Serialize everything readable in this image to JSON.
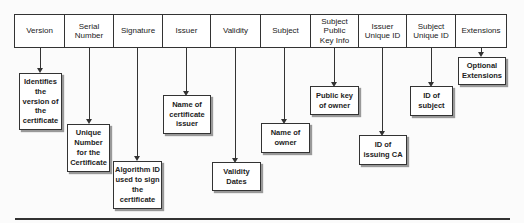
{
  "diagram": {
    "fields": [
      {
        "label": "Version",
        "description": "Identifies the version of the certificate"
      },
      {
        "label": "Serial Number",
        "description": "Unique Number for the Certificate"
      },
      {
        "label": "Signature",
        "description": "Algorithm ID used to sign the certificate"
      },
      {
        "label": "Issuer",
        "description": "Name of certificate issuer"
      },
      {
        "label": "Validity",
        "description": "Validity Dates"
      },
      {
        "label": "Subject",
        "description": "Name of owner"
      },
      {
        "label": "Subject Public Key Info",
        "description": "Public key of owner"
      },
      {
        "label": "Issuer Unique ID",
        "description": "ID of issuing CA"
      },
      {
        "label": "Subject Unique ID",
        "description": "ID of subject"
      },
      {
        "label": "Extensions",
        "description": "Optional Extensions"
      }
    ]
  }
}
